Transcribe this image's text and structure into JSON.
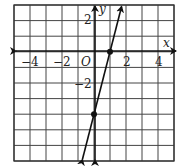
{
  "chart_data": {
    "type": "line",
    "title": "",
    "xlabel": "x",
    "ylabel": "y",
    "origin_label": "O",
    "xlim": [
      -5,
      5
    ],
    "ylim": [
      -7,
      3
    ],
    "grid": true,
    "x_tick_labels": [
      "-4",
      "-2",
      "2",
      "4"
    ],
    "y_tick_labels": [
      "2",
      "-2"
    ],
    "series": [
      {
        "name": "line",
        "equation": "y = 4x - 4",
        "slope": 4,
        "intercept": -4,
        "marked_points": [
          [
            1,
            0
          ],
          [
            0,
            -4
          ]
        ]
      }
    ]
  },
  "labels": {
    "x_axis": "x",
    "y_axis": "y",
    "origin": "O",
    "xt_m4": "−4",
    "xt_m2": "−2",
    "xt_2": "2",
    "xt_4": "4",
    "yt_2": "2",
    "yt_m2": "−2"
  }
}
